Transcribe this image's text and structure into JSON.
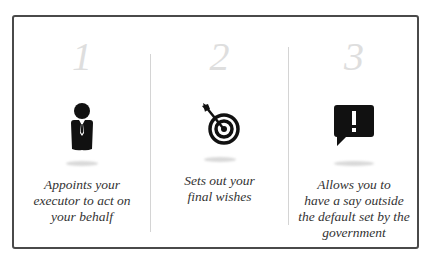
{
  "columns": [
    {
      "number": "1",
      "icon": "businessman-icon",
      "description": "Appoints your executor to act on your behalf",
      "lines": [
        "Appoints your",
        "executor to act on",
        "your behalf"
      ]
    },
    {
      "number": "2",
      "icon": "target-arrow-icon",
      "description": "Sets out your final wishes",
      "lines": [
        "Sets out your",
        "final wishes"
      ]
    },
    {
      "number": "3",
      "icon": "alert-speech-bubble-icon",
      "description": "Allows you to have a say outside the default set by the government",
      "lines": [
        "Allows you to",
        "have a say outside",
        "the default set by the",
        "government"
      ]
    }
  ],
  "colors": {
    "border": "#4a4a4a",
    "number": "#dedede",
    "icon": "#111111",
    "text": "#333333",
    "divider": "#d4d4d4"
  }
}
